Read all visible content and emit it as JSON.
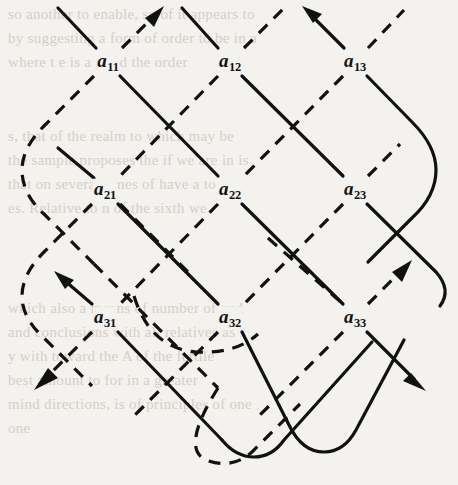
{
  "figure": {
    "kind": "matrix-diagonal-product-diagram",
    "matrix": {
      "rows": 3,
      "cols": 3,
      "entries": [
        [
          {
            "id": "a11",
            "base": "a",
            "sub": "11",
            "x": 108,
            "y": 62
          },
          {
            "id": "a12",
            "base": "a",
            "sub": "12",
            "x": 230,
            "y": 62
          },
          {
            "id": "a13",
            "base": "a",
            "sub": "13",
            "x": 355,
            "y": 62
          }
        ],
        [
          {
            "id": "a21",
            "base": "a",
            "sub": "21",
            "x": 105,
            "y": 190
          },
          {
            "id": "a22",
            "base": "a",
            "sub": "22",
            "x": 230,
            "y": 190
          },
          {
            "id": "a23",
            "base": "a",
            "sub": "23",
            "x": 355,
            "y": 190
          }
        ],
        [
          {
            "id": "a31",
            "base": "a",
            "sub": "31",
            "x": 105,
            "y": 318
          },
          {
            "id": "a32",
            "base": "a",
            "sub": "32",
            "x": 230,
            "y": 318
          },
          {
            "id": "a33",
            "base": "a",
            "sub": "33",
            "x": 355,
            "y": 318
          }
        ]
      ]
    },
    "line_styles": {
      "positive_diagonal": "solid",
      "negative_diagonal": "dashed"
    },
    "colors": {
      "ink": "#111111",
      "paper": "#f4f2ee",
      "ghost_text": "#cfcabf"
    },
    "arrow_count": 6,
    "ghost_text_lines": [
      {
        "text": "so another to enable, so of it appears to",
        "x": 8,
        "y": 6
      },
      {
        "text": "by suggesting a form of order to be in a",
        "x": 8,
        "y": 30
      },
      {
        "text": "where t e is a mind the order",
        "x": 8,
        "y": 54
      },
      {
        "text": "s, that of the realm to which may be",
        "x": 8,
        "y": 128
      },
      {
        "text": "the sample proposes the if we are in is",
        "x": 8,
        "y": 152
      },
      {
        "text": "that on several times of have a to",
        "x": 8,
        "y": 176
      },
      {
        "text": "es. Relative to n of the sixth we",
        "x": 8,
        "y": 200
      },
      {
        "text": "which also a means of number of and",
        "x": 8,
        "y": 300
      },
      {
        "text": "and conclusions with all relatives as",
        "x": 8,
        "y": 324
      },
      {
        "text": "y with toward the A of the fertile",
        "x": 8,
        "y": 348
      },
      {
        "text": "best amount to for in a greater",
        "x": 8,
        "y": 372
      },
      {
        "text": "mind directions, is of principles of one",
        "x": 8,
        "y": 396
      },
      {
        "text": "one",
        "x": 8,
        "y": 420
      }
    ]
  }
}
